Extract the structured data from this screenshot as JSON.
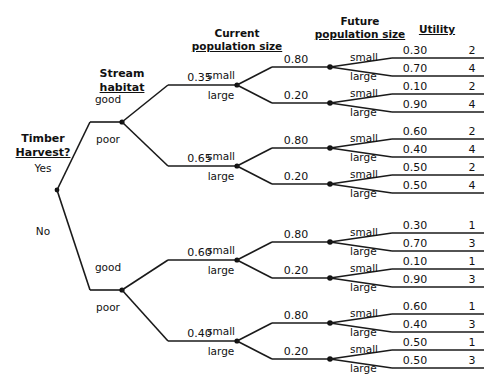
{
  "diagram": {
    "type": "decision-tree",
    "line_color": "#1a1a1a",
    "text_color": "#111111",
    "background": "#ffffff"
  },
  "headers": [
    {
      "name": "decision-header",
      "line1": "Timber",
      "line2": "Harvest?"
    },
    {
      "name": "stream-habitat-header",
      "line1": "Stream",
      "line2": "habitat"
    },
    {
      "name": "current-population-header",
      "line1": "Current",
      "line2": "population size"
    },
    {
      "name": "future-population-header",
      "line1": "Future",
      "line2": "population size"
    },
    {
      "name": "utility-header",
      "line1": "",
      "line2": "Utility"
    }
  ],
  "decision": {
    "label_line1": "Timber",
    "label_line2": "Harvest?",
    "options": [
      {
        "label": "Yes",
        "branch": "yes"
      },
      {
        "label": "No",
        "branch": "no"
      }
    ]
  },
  "habitat_labels": {
    "good": "good",
    "poor": "poor"
  },
  "size_labels": {
    "small": "small",
    "large": "large"
  },
  "branches": {
    "yes": {
      "option_label": "Yes",
      "habitat": [
        {
          "state": "good",
          "prob": "0.35",
          "current": [
            {
              "size": "small",
              "prob": "0.80",
              "future": [
                {
                  "size": "small",
                  "prob": "0.30",
                  "utility": "2"
                },
                {
                  "size": "large",
                  "prob": "0.70",
                  "utility": "4"
                }
              ]
            },
            {
              "size": "large",
              "prob": "0.20",
              "future": [
                {
                  "size": "small",
                  "prob": "0.10",
                  "utility": "2"
                },
                {
                  "size": "large",
                  "prob": "0.90",
                  "utility": "4"
                }
              ]
            }
          ]
        },
        {
          "state": "poor",
          "prob": "0.65",
          "current": [
            {
              "size": "small",
              "prob": "0.80",
              "future": [
                {
                  "size": "small",
                  "prob": "0.60",
                  "utility": "2"
                },
                {
                  "size": "large",
                  "prob": "0.40",
                  "utility": "4"
                }
              ]
            },
            {
              "size": "large",
              "prob": "0.20",
              "future": [
                {
                  "size": "small",
                  "prob": "0.50",
                  "utility": "2"
                },
                {
                  "size": "large",
                  "prob": "0.50",
                  "utility": "4"
                }
              ]
            }
          ]
        }
      ]
    },
    "no": {
      "option_label": "No",
      "habitat": [
        {
          "state": "good",
          "prob": "0.60",
          "current": [
            {
              "size": "small",
              "prob": "0.80",
              "future": [
                {
                  "size": "small",
                  "prob": "0.30",
                  "utility": "1"
                },
                {
                  "size": "large",
                  "prob": "0.70",
                  "utility": "3"
                }
              ]
            },
            {
              "size": "large",
              "prob": "0.20",
              "future": [
                {
                  "size": "small",
                  "prob": "0.10",
                  "utility": "1"
                },
                {
                  "size": "large",
                  "prob": "0.90",
                  "utility": "3"
                }
              ]
            }
          ]
        },
        {
          "state": "poor",
          "prob": "0.40",
          "current": [
            {
              "size": "small",
              "prob": "0.80",
              "future": [
                {
                  "size": "small",
                  "prob": "0.60",
                  "utility": "1"
                },
                {
                  "size": "large",
                  "prob": "0.40",
                  "utility": "3"
                }
              ]
            },
            {
              "size": "large",
              "prob": "0.20",
              "future": [
                {
                  "size": "small",
                  "prob": "0.50",
                  "utility": "1"
                },
                {
                  "size": "large",
                  "prob": "0.50",
                  "utility": "3"
                }
              ]
            }
          ]
        }
      ]
    }
  },
  "geometry": {
    "root_x": 57,
    "root_y": 190,
    "root_stub_x": 90,
    "habitat_x": 122,
    "habitat_y": [
      122,
      290
    ],
    "current_node_x": 237,
    "current_prob_line_x0": 168,
    "future_node_x": 330,
    "future_prob_line_x0": 272,
    "terminal_x0": 392,
    "terminal_x1": 484,
    "terminal_rows_y": [
      58,
      76,
      94,
      112,
      139,
      157,
      175,
      193,
      233,
      251,
      269,
      287,
      314,
      332,
      350,
      368
    ],
    "current_rows_y": [
      67,
      103,
      148,
      184,
      242,
      278,
      323,
      359
    ],
    "header_y": 20
  }
}
